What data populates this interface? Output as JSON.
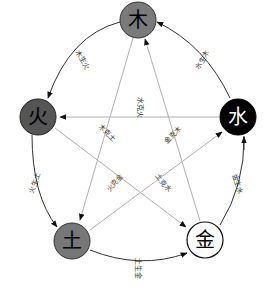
{
  "nodes": {
    "wood": {
      "char": "木",
      "fill": "#7a7a7a",
      "text": "#000000",
      "stroke": "#333333"
    },
    "water": {
      "char": "水",
      "fill": "#000000",
      "text": "#ffffff",
      "stroke": "#000000"
    },
    "fire": {
      "char": "火",
      "fill": "#555555",
      "text": "#000000",
      "stroke": "#222222"
    },
    "earth": {
      "char": "土",
      "fill": "#777777",
      "text": "#000000",
      "stroke": "#333333"
    },
    "metal": {
      "char": "金",
      "fill": "#ffffff",
      "text": "#000000",
      "stroke": "#000000"
    }
  },
  "generating": {
    "wood_fire": "木生火",
    "fire_earth": "火生土",
    "earth_metal": "土生金",
    "metal_water": "金生水",
    "water_wood": "水生木"
  },
  "controlling": {
    "water_fire": "水克火",
    "wood_earth": "木克土",
    "earth_water": "土克水",
    "fire_metal": "火克金",
    "metal_wood": "金克木"
  },
  "colors": {
    "generating_line": "#333333",
    "controlling_line": "#b0b0b0"
  }
}
